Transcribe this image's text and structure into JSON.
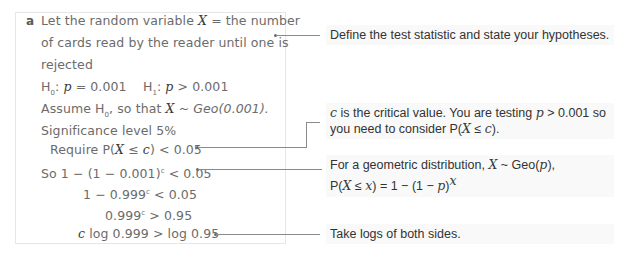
{
  "part": "a",
  "working": [
    {
      "pre": "Let the random variable ",
      "var": "X",
      "post": " = the number"
    },
    {
      "text": "of cards read by the reader until one is"
    },
    {
      "text": "rejected"
    },
    {
      "h0": "H",
      "h0sub": "0",
      "h0rest": ": ",
      "p1": "p",
      "h0val": " = 0.001",
      "h1": "H",
      "h1sub": "1",
      "h1rest": ": ",
      "p2": "p",
      "h1val": " > 0.001"
    },
    {
      "pre": "Assume H",
      "sub": "0",
      "mid": ", so that ",
      "var": "X",
      "post": " ~ ",
      "geo": "Geo(0.001)."
    },
    {
      "text": "Significance level 5%"
    },
    {
      "pre": "Require P(",
      "var": "X",
      "mid": " ≤ ",
      "var2": "c",
      "post": ") < 0.05"
    },
    {
      "pre": "So 1 − (1 − 0.001)",
      "sup": "c",
      "post": " < 0.05"
    },
    {
      "pre": "1 − 0.999",
      "sup": "c",
      "post": " < 0.05"
    },
    {
      "pre": "0.999",
      "sup": "c",
      "post": " > 0.95"
    },
    {
      "var": "c",
      "post": " log 0.999 > log 0.95"
    }
  ],
  "notes": {
    "n1": {
      "text": "Define the test statistic and state your hypotheses."
    },
    "n2": {
      "var": "c",
      "t1": " is the critical value. You are testing ",
      "p": "p",
      "t2": " > 0.001 so",
      "t3": "you need to consider P(",
      "X": "X",
      "t4": " ≤ ",
      "c": "c",
      "t5": ")."
    },
    "n3": {
      "t1": "For a geometric distribution, ",
      "X": "X",
      "t2": " ~ Geo(",
      "p": "p",
      "t3": "),",
      "t4": "P(",
      "X2": "X",
      "t5": " ≤ ",
      "x": "x",
      "t6": ") = 1 − (1 − ",
      "p2": "p",
      "t7": ")",
      "sup": "x"
    },
    "n4": {
      "text": "Take logs of both sides."
    }
  }
}
